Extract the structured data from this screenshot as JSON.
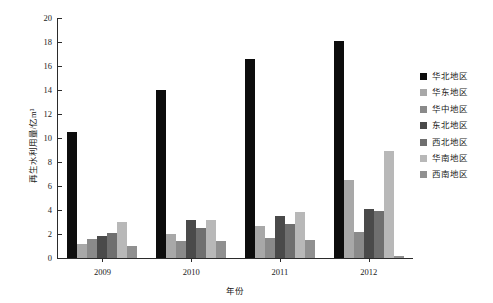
{
  "chart_data": {
    "type": "bar",
    "title": "",
    "xlabel": "年份",
    "ylabel": "再生水利用量/亿m³",
    "categories": [
      "2009",
      "2010",
      "2011",
      "2012"
    ],
    "ylim": [
      0,
      20
    ],
    "yticks": [
      0,
      2,
      4,
      6,
      8,
      10,
      12,
      14,
      16,
      18,
      20
    ],
    "grid": false,
    "legend_position": "right",
    "series": [
      {
        "name": "华北地区",
        "color": "#0d0d0d",
        "values": [
          10.5,
          14.0,
          16.6,
          18.1
        ]
      },
      {
        "name": "华东地区",
        "color": "#a8a8a8",
        "values": [
          1.2,
          2.0,
          2.7,
          6.5
        ]
      },
      {
        "name": "华中地区",
        "color": "#8a8a8a",
        "values": [
          1.6,
          1.4,
          1.7,
          2.2
        ]
      },
      {
        "name": "东北地区",
        "color": "#4a4a4a",
        "values": [
          1.8,
          3.2,
          3.5,
          4.1
        ]
      },
      {
        "name": "西北地区",
        "color": "#6f6f6f",
        "values": [
          2.1,
          2.5,
          2.8,
          3.9
        ]
      },
      {
        "name": "华南地区",
        "color": "#b8b8b8",
        "values": [
          3.0,
          3.2,
          3.8,
          8.9
        ]
      },
      {
        "name": "西南地区",
        "color": "#909090",
        "values": [
          1.0,
          1.4,
          1.5,
          0.2
        ]
      }
    ]
  },
  "axis": {
    "tick_labels_y": [
      "20",
      "18",
      "16",
      "14",
      "12",
      "10",
      "8",
      "6",
      "4",
      "2",
      "0"
    ]
  }
}
